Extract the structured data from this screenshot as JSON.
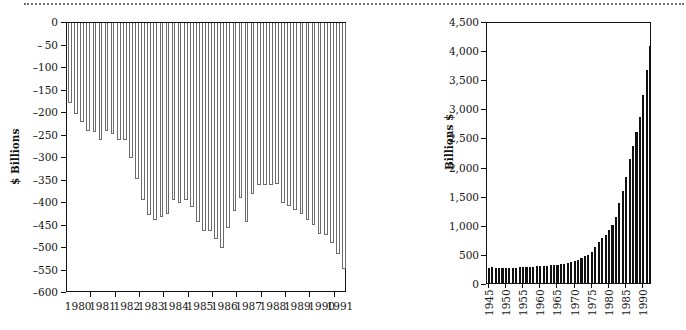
{
  "page": {
    "background_color": "#ffffff",
    "ink_color": "#111111",
    "top_rule": "dotted-rule"
  },
  "chart_data": [
    {
      "id": "deficit-chart",
      "type": "bar",
      "title": "",
      "xlabel": "",
      "ylabel": "$ Billions",
      "ylim": [
        -600,
        0
      ],
      "yticks": [
        0,
        -50,
        -100,
        -150,
        -200,
        -250,
        -300,
        -350,
        -400,
        -450,
        -500,
        -550,
        -600
      ],
      "ytick_labels": [
        "0",
        "– 50",
        "–100",
        "–150",
        "–200",
        "–250",
        "–300",
        "–350",
        "–400",
        "–450",
        "–500",
        "–550",
        "–600"
      ],
      "xtick_labels": [
        "1980",
        "1981",
        "1982",
        "1983",
        "1984",
        "1985",
        "1986",
        "1987",
        "1988",
        "1989",
        "1990",
        "1991"
      ],
      "grid": false,
      "legend": false,
      "bar_style": "hollow-outline",
      "categories": [
        "1980Q1",
        "1980Q2",
        "1980Q3",
        "1980Q4",
        "1981Q1",
        "1981Q2",
        "1981Q3",
        "1981Q4",
        "1982Q1",
        "1982Q2",
        "1982Q3",
        "1982Q4",
        "1983Q1",
        "1983Q2",
        "1983Q3",
        "1983Q4",
        "1984Q1",
        "1984Q2",
        "1984Q3",
        "1984Q4",
        "1985Q1",
        "1985Q2",
        "1985Q3",
        "1985Q4",
        "1986Q1",
        "1986Q2",
        "1986Q3",
        "1986Q4",
        "1987Q1",
        "1987Q2",
        "1987Q3",
        "1987Q4",
        "1988Q1",
        "1988Q2",
        "1988Q3",
        "1988Q4",
        "1989Q1",
        "1989Q2",
        "1989Q3",
        "1989Q4",
        "1990Q1",
        "1990Q2",
        "1990Q3",
        "1990Q4",
        "1991Q1",
        "1991Q2"
      ],
      "values": [
        -178,
        -202,
        -221,
        -240,
        -242,
        -260,
        -240,
        -246,
        -259,
        -260,
        -300,
        -346,
        -393,
        -427,
        -438,
        -432,
        -424,
        -393,
        -401,
        -394,
        -409,
        -443,
        -462,
        -463,
        -480,
        -501,
        -455,
        -417,
        -389,
        -443,
        -381,
        -361,
        -359,
        -359,
        -358,
        -401,
        -406,
        -416,
        -425,
        -437,
        -448,
        -468,
        -470,
        -489,
        -514,
        -546
      ]
    },
    {
      "id": "debt-chart",
      "type": "bar",
      "title": "",
      "xlabel": "",
      "ylabel": "Billions $",
      "ylim": [
        0,
        4500
      ],
      "yticks": [
        0,
        500,
        1000,
        1500,
        2000,
        2500,
        3000,
        3500,
        4000,
        4500
      ],
      "ytick_labels": [
        "0",
        "500",
        "1,000",
        "1,500",
        "2,000",
        "2,500",
        "3,000",
        "3,500",
        "4,000",
        "4,500"
      ],
      "xtick_labels": [
        "1945",
        "1950",
        "1955",
        "1960",
        "1965",
        "1970",
        "1975",
        "1980",
        "1985",
        "1990"
      ],
      "grid": false,
      "legend": false,
      "bar_style": "solid-black",
      "categories": [
        "1945",
        "1946",
        "1947",
        "1948",
        "1949",
        "1950",
        "1951",
        "1952",
        "1953",
        "1954",
        "1955",
        "1956",
        "1957",
        "1958",
        "1959",
        "1960",
        "1961",
        "1962",
        "1963",
        "1964",
        "1965",
        "1966",
        "1967",
        "1968",
        "1969",
        "1970",
        "1971",
        "1972",
        "1973",
        "1974",
        "1975",
        "1976",
        "1977",
        "1978",
        "1979",
        "1980",
        "1981",
        "1982",
        "1983",
        "1984",
        "1985",
        "1986",
        "1987",
        "1988",
        "1989",
        "1990",
        "1991",
        "1992"
      ],
      "values": [
        259,
        269,
        258,
        252,
        253,
        257,
        255,
        259,
        266,
        271,
        274,
        273,
        271,
        276,
        285,
        286,
        289,
        298,
        306,
        312,
        317,
        320,
        326,
        348,
        354,
        371,
        398,
        427,
        458,
        475,
        533,
        620,
        699,
        772,
        827,
        908,
        998,
        1142,
        1377,
        1572,
        1823,
        2125,
        2350,
        2602,
        2857,
        3233,
        3665,
        4065
      ]
    }
  ]
}
